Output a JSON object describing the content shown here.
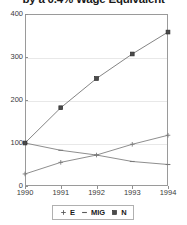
{
  "chart_data": {
    "type": "line",
    "title": "by a 0.4% Wage Equivalent",
    "xlabel": "",
    "ylabel": "",
    "x": [
      1990,
      1991,
      1992,
      1993,
      1994
    ],
    "categories": [
      "1990",
      "1991",
      "1992",
      "1993",
      "1994"
    ],
    "xlim": [
      1990,
      1994
    ],
    "ylim": [
      0,
      400
    ],
    "yticks": [
      0,
      100,
      200,
      300,
      400
    ],
    "ytick_labels": [
      "0",
      "100",
      "200",
      "300",
      "400"
    ],
    "xticks": [
      1990,
      1991,
      1992,
      1993,
      1994
    ],
    "xtick_labels": [
      "1990",
      "1991",
      "1992",
      "1993",
      "1994"
    ],
    "grid": true,
    "grid_axis": "y",
    "legend_position": "bottom",
    "series": [
      {
        "name": "E",
        "marker": "plus",
        "color": "#7a7a7a",
        "values": [
          28,
          55,
          72,
          97,
          118
        ]
      },
      {
        "name": "MIG",
        "marker": "dash",
        "color": "#7a7a7a",
        "values": [
          100,
          83,
          72,
          57,
          50
        ]
      },
      {
        "name": "N",
        "marker": "square",
        "color": "#6e6e6e",
        "values": [
          100,
          182,
          250,
          307,
          358
        ]
      }
    ]
  },
  "axes": {
    "y_ticks": [
      {
        "label": "400",
        "value": 400
      },
      {
        "label": "300",
        "value": 300
      },
      {
        "label": "200",
        "value": 200
      },
      {
        "label": "100",
        "value": 100
      },
      {
        "label": "0",
        "value": 0
      }
    ],
    "x_ticks": [
      {
        "label": "1990",
        "value": 1990
      },
      {
        "label": "1991",
        "value": 1991
      },
      {
        "label": "1992",
        "value": 1992
      },
      {
        "label": "1993",
        "value": 1993
      },
      {
        "label": "1994",
        "value": 1994
      }
    ]
  },
  "legend": {
    "entries": [
      {
        "label": "E",
        "marker": "plus"
      },
      {
        "label": "MIG",
        "marker": "dash"
      },
      {
        "label": "N",
        "marker": "square"
      }
    ]
  },
  "colors": {
    "plot_border": "#9a9a9a",
    "gridline": "#e8e8e8",
    "series_line": "#7a7a7a",
    "text": "#1a1a1a",
    "background": "#ffffff"
  }
}
